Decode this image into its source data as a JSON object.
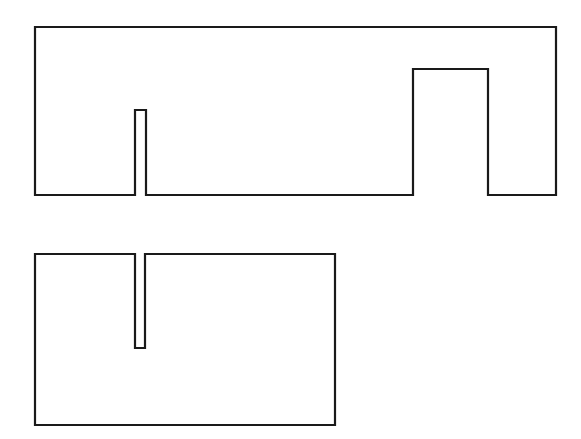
{
  "diagram": {
    "type": "puzzle-shapes",
    "background": "#ffffff",
    "stroke_color": "#1a1a1a",
    "shapes": [
      {
        "name": "top-shape",
        "description": "Wide rectangle with a narrow tall notch and a wide notch cut into its bottom edge",
        "points": "35,27 556,27 556,195 488,195 488,69 413,69 413,195 146,195 146,110 135,110 135,195 35,195"
      },
      {
        "name": "bottom-shape",
        "description": "Rectangle with a narrow slot cut down from its top edge",
        "points": "35,254 135,254 135,348 145,348 145,254 335,254 335,425 35,425"
      }
    ]
  }
}
